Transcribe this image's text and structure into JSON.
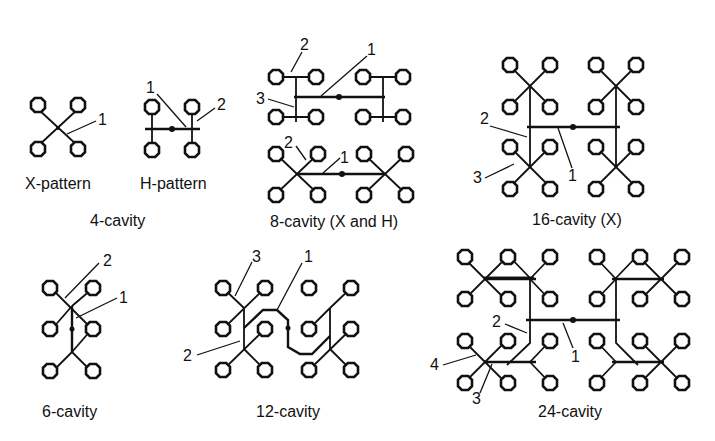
{
  "diagram": {
    "legend_numbers": [
      "1",
      "2",
      "3",
      "4"
    ],
    "groups": [
      {
        "id": "4-cavity",
        "caption": "4-cavity",
        "variants": [
          {
            "label": "X-pattern",
            "callouts": [
              "1"
            ]
          },
          {
            "label": "H-pattern",
            "callouts": [
              "1",
              "2"
            ]
          }
        ]
      },
      {
        "id": "8-cavity",
        "caption": "8-cavity (X and H)",
        "variants": [
          {
            "label": "H layout (top)",
            "callouts": [
              "2",
              "1",
              "3"
            ]
          },
          {
            "label": "X layout (bottom)",
            "callouts": [
              "2",
              "1"
            ]
          }
        ]
      },
      {
        "id": "16-cavity",
        "caption": "16-cavity (X)",
        "callouts": [
          "2",
          "3",
          "1"
        ]
      },
      {
        "id": "6-cavity",
        "caption": "6-cavity",
        "callouts": [
          "2",
          "1"
        ]
      },
      {
        "id": "12-cavity",
        "caption": "12-cavity",
        "callouts": [
          "3",
          "1",
          "2"
        ]
      },
      {
        "id": "24-cavity",
        "caption": "24-cavity",
        "callouts": [
          "2",
          "1",
          "4",
          "3"
        ]
      }
    ],
    "colors": {
      "ink": "#111111",
      "background": "#ffffff"
    }
  }
}
